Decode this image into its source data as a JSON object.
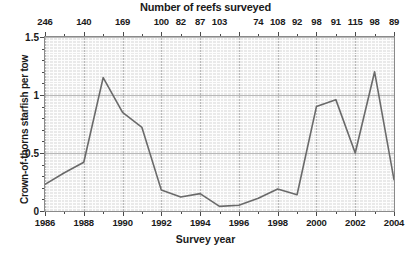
{
  "chart_data": {
    "type": "line",
    "title": "Number of reefs surveyed",
    "xlabel": "Survey year",
    "ylabel": "Crown-of-thorns starfish per tow",
    "x": [
      1986,
      1987,
      1988,
      1989,
      1990,
      1991,
      1992,
      1993,
      1994,
      1995,
      1996,
      1997,
      1998,
      1999,
      2000,
      2001,
      2002,
      2003,
      2004
    ],
    "values": [
      0.23,
      0.33,
      0.42,
      1.15,
      0.85,
      0.72,
      0.18,
      0.12,
      0.15,
      0.04,
      0.05,
      0.11,
      0.19,
      0.14,
      0.9,
      0.96,
      0.5,
      1.2,
      0.27
    ],
    "xlim": [
      1986,
      2004
    ],
    "ylim": [
      0,
      1.5
    ],
    "yticks": [
      "0",
      "0.5",
      "1",
      "1.5"
    ],
    "ytick_values": [
      0,
      0.5,
      1,
      1.5
    ],
    "xticks": [
      "1986",
      "1988",
      "1990",
      "1992",
      "1994",
      "1996",
      "1998",
      "2000",
      "2002",
      "2004"
    ],
    "xtick_values": [
      1986,
      1988,
      1990,
      1992,
      1994,
      1996,
      1998,
      2000,
      2002,
      2004
    ],
    "grid": true,
    "legend": "none",
    "line_color": "#6a6a6a",
    "plot_bg": "#e9e9e9",
    "grid_color": "#fdfdfd",
    "grid_major_color": "#b9b9b9",
    "top_axis": {
      "title": "Number of reefs surveyed",
      "labels": [
        {
          "year": 1986,
          "value": "246"
        },
        {
          "year": 1988,
          "value": "140"
        },
        {
          "year": 1990,
          "value": "169"
        },
        {
          "year": 1992,
          "value": "100"
        },
        {
          "year": 1993,
          "value": "82"
        },
        {
          "year": 1994,
          "value": "87"
        },
        {
          "year": 1995,
          "value": "103"
        },
        {
          "year": 1997,
          "value": "74"
        },
        {
          "year": 1998,
          "value": "108"
        },
        {
          "year": 1999,
          "value": "92"
        },
        {
          "year": 2000,
          "value": "98"
        },
        {
          "year": 2001,
          "value": "91"
        },
        {
          "year": 2002,
          "value": "115"
        },
        {
          "year": 2003,
          "value": "98"
        },
        {
          "year": 2004,
          "value": "89"
        }
      ]
    }
  }
}
